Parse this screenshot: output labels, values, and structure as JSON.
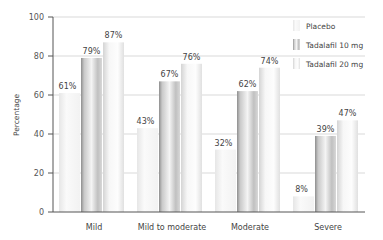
{
  "chart_data": {
    "type": "bar",
    "title": "",
    "xlabel": "",
    "ylabel": "Percentage",
    "ylim": [
      0,
      100
    ],
    "yticks": [
      0,
      20,
      40,
      60,
      80,
      100
    ],
    "grid": true,
    "legend_position": "top-right",
    "categories": [
      "Mild",
      "Mild to moderate",
      "Moderate",
      "Severe"
    ],
    "series": [
      {
        "name": "Placebo",
        "values": [
          61,
          43,
          32,
          8
        ],
        "labels": [
          "61%",
          "43%",
          "32%",
          "8%"
        ],
        "color": "#f4f4f4"
      },
      {
        "name": "Tadalafil 10 mg",
        "values": [
          79,
          67,
          62,
          39
        ],
        "labels": [
          "79%",
          "67%",
          "62%",
          "39%"
        ],
        "color": "#b8b8b8"
      },
      {
        "name": "Tadalafil 20 mg",
        "values": [
          87,
          76,
          74,
          47
        ],
        "labels": [
          "87%",
          "76%",
          "74%",
          "47%"
        ],
        "color": "#e2e2e2"
      }
    ]
  }
}
